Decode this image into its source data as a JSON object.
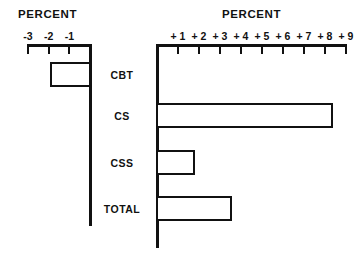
{
  "chart_data": {
    "type": "bar",
    "orientation": "horizontal",
    "title": "",
    "left_panel": {
      "title": "PERCENT",
      "tick_labels": [
        "-3",
        "-2",
        "-1"
      ],
      "tick_values": [
        -3,
        -2,
        -1
      ],
      "axis_min": -3,
      "axis_max": 0
    },
    "right_panel": {
      "title": "PERCENT",
      "tick_labels": [
        "+ 1",
        "+ 2",
        "+ 3",
        "+ 4",
        "+ 5",
        "+ 6",
        "+ 7",
        "+ 8",
        "+ 9"
      ],
      "tick_values": [
        1,
        2,
        3,
        4,
        5,
        6,
        7,
        8,
        9
      ],
      "axis_min": 0,
      "axis_max": 9
    },
    "categories": [
      "CBT",
      "CS",
      "CSS",
      "TOTAL"
    ],
    "values": [
      -1.9,
      8.3,
      1.75,
      3.5
    ],
    "xlabel": "PERCENT",
    "ylabel": "",
    "grid": false,
    "legend": null,
    "bar_fill": "#ffffff",
    "bar_stroke": "#111111",
    "axis_color": "#111111"
  },
  "rows": [
    {
      "label": "CBT",
      "value": -1.9
    },
    {
      "label": "CS",
      "value": 8.3
    },
    {
      "label": "CSS",
      "value": 1.75
    },
    {
      "label": "TOTAL",
      "value": 3.5
    }
  ],
  "left_axis": {
    "title": "PERCENT",
    "ticks": [
      {
        "label": "-3"
      },
      {
        "label": "-2"
      },
      {
        "label": "-1"
      }
    ]
  },
  "right_axis": {
    "title": "PERCENT",
    "ticks": [
      {
        "label": "+ 1"
      },
      {
        "label": "+ 2"
      },
      {
        "label": "+ 3"
      },
      {
        "label": "+ 4"
      },
      {
        "label": "+ 5"
      },
      {
        "label": "+ 6"
      },
      {
        "label": "+ 7"
      },
      {
        "label": "+ 8"
      },
      {
        "label": "+ 9"
      }
    ]
  }
}
